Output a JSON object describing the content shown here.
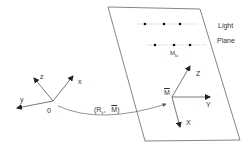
{
  "diagram": {
    "world_frame": {
      "origin_label": "0",
      "axes": {
        "x": "x",
        "y": "y",
        "z": "z"
      }
    },
    "transform_label": {
      "open": "(R",
      "sub": "k",
      "comma": ",",
      "vec": "M",
      "close": ")"
    },
    "light_plane": {
      "title_line1": "Light",
      "title_line2": "Plane",
      "point_label": "M",
      "point_label_sub": "ki",
      "frame_origin_label": "M",
      "axes": {
        "x": "X",
        "y": "Y",
        "z": "Z"
      }
    },
    "colors": {
      "line": "#555555",
      "text": "#333333",
      "dots": "#111111"
    }
  }
}
